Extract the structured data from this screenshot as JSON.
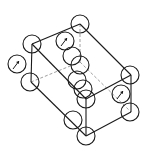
{
  "diagram": {
    "colors": {
      "line": "#1a1a1a",
      "hidden_line": "#888888",
      "background": "#ffffff"
    },
    "atom_radius": 9,
    "vertices": {
      "top": [
        80,
        24
      ],
      "upper_left": [
        32,
        44
      ],
      "lower_left": [
        31,
        82
      ],
      "front_mid": [
        86,
        99
      ],
      "right_top": [
        131,
        75
      ],
      "right_bottom": [
        131,
        112
      ],
      "bottom": [
        86,
        136
      ],
      "back_hidden": [
        80,
        62
      ]
    },
    "edges_solid": [
      [
        [
          32,
          44
        ],
        [
          80,
          24
        ]
      ],
      [
        [
          80,
          24
        ],
        [
          131,
          75
        ]
      ],
      [
        [
          32,
          44
        ],
        [
          86,
          99
        ]
      ],
      [
        [
          86,
          99
        ],
        [
          131,
          75
        ]
      ],
      [
        [
          32,
          44
        ],
        [
          31,
          82
        ]
      ],
      [
        [
          31,
          82
        ],
        [
          86,
          136
        ]
      ],
      [
        [
          86,
          99
        ],
        [
          86,
          136
        ]
      ],
      [
        [
          86,
          136
        ],
        [
          131,
          112
        ]
      ],
      [
        [
          131,
          75
        ],
        [
          131,
          112
        ]
      ]
    ],
    "edges_hidden": [
      [
        [
          80,
          24
        ],
        [
          80,
          62
        ]
      ],
      [
        [
          31,
          82
        ],
        [
          80,
          62
        ]
      ],
      [
        [
          80,
          62
        ],
        [
          131,
          112
        ]
      ]
    ],
    "atoms": [
      {
        "id": "atom-top",
        "cx": 80,
        "cy": 24,
        "arrow": false
      },
      {
        "id": "atom-upper-left",
        "cx": 32,
        "cy": 44,
        "arrow": false
      },
      {
        "id": "atom-left-arrow",
        "cx": 17,
        "cy": 64,
        "arrow": true
      },
      {
        "id": "atom-lower-left",
        "cx": 30,
        "cy": 82,
        "arrow": false
      },
      {
        "id": "atom-inner-top-arrow",
        "cx": 65,
        "cy": 41,
        "arrow": true
      },
      {
        "id": "atom-center-1",
        "cx": 72,
        "cy": 56,
        "arrow": false
      },
      {
        "id": "atom-center-2",
        "cx": 80,
        "cy": 65,
        "arrow": false
      },
      {
        "id": "atom-center-3",
        "cx": 77,
        "cy": 80,
        "arrow": false
      },
      {
        "id": "atom-center-4",
        "cx": 83,
        "cy": 89,
        "arrow": false
      },
      {
        "id": "atom-front-mid",
        "cx": 86,
        "cy": 99,
        "arrow": false
      },
      {
        "id": "atom-right-top",
        "cx": 130,
        "cy": 75,
        "arrow": false
      },
      {
        "id": "atom-right-arrow",
        "cx": 121,
        "cy": 94,
        "arrow": true
      },
      {
        "id": "atom-right-bottom",
        "cx": 130,
        "cy": 112,
        "arrow": false
      },
      {
        "id": "atom-bottom-left",
        "cx": 73,
        "cy": 120,
        "arrow": false
      },
      {
        "id": "atom-bottom",
        "cx": 86,
        "cy": 136,
        "arrow": false
      }
    ]
  }
}
